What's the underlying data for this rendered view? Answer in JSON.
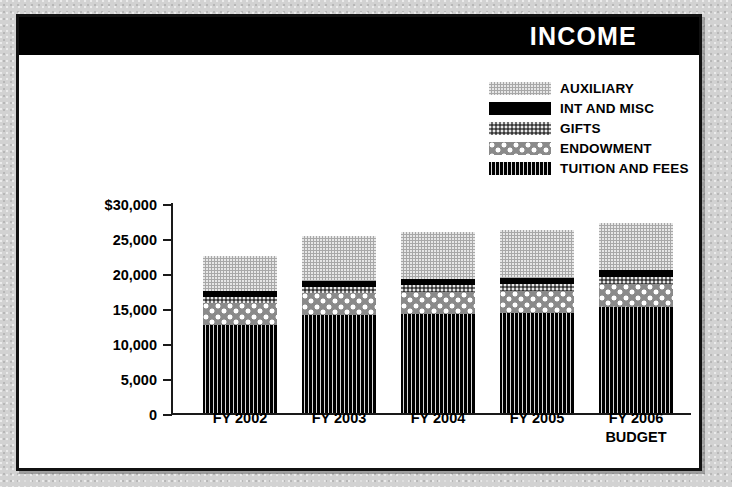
{
  "header": {
    "title": "INCOME"
  },
  "legend": {
    "position": "top-right",
    "items": [
      {
        "label": "AUXILIARY",
        "pattern": "auxiliary",
        "color": "#a8a8a8"
      },
      {
        "label": "INT AND MISC",
        "pattern": "int",
        "color": "#000000"
      },
      {
        "label": "GIFTS",
        "pattern": "gifts",
        "color": "#6f6f6f"
      },
      {
        "label": "ENDOWMENT",
        "pattern": "endowment",
        "color": "#8a8a8a"
      },
      {
        "label": "TUITION AND FEES",
        "pattern": "tuition",
        "color": "#111111"
      }
    ]
  },
  "axis": {
    "y_ticks": [
      "$30,000",
      "25,000",
      "20,000",
      "15,000",
      "10,000",
      "5,000",
      "0"
    ],
    "x_labels": [
      {
        "line1": "FY 2002",
        "line2": ""
      },
      {
        "line1": "FY 2003",
        "line2": ""
      },
      {
        "line1": "FY 2004",
        "line2": ""
      },
      {
        "line1": "FY 2005",
        "line2": ""
      },
      {
        "line1": "FY 2006",
        "line2": "BUDGET"
      }
    ]
  },
  "chart_data": {
    "type": "bar",
    "stacked": true,
    "title": "INCOME",
    "xlabel": "",
    "ylabel": "",
    "ylim": [
      0,
      30000
    ],
    "ytick_values": [
      0,
      5000,
      10000,
      15000,
      20000,
      25000,
      30000
    ],
    "grid": false,
    "legend_position": "top-right",
    "categories": [
      "FY 2002",
      "FY 2003",
      "FY 2004",
      "FY 2005",
      "FY 2006 BUDGET"
    ],
    "series": [
      {
        "name": "TUITION AND FEES",
        "values": [
          12600,
          14000,
          14100,
          14300,
          15200
        ]
      },
      {
        "name": "ENDOWMENT",
        "values": [
          3100,
          3100,
          3200,
          3200,
          3200
        ]
      },
      {
        "name": "GIFTS",
        "values": [
          900,
          900,
          1000,
          1000,
          1100
        ]
      },
      {
        "name": "INT AND MISC",
        "values": [
          800,
          800,
          800,
          800,
          900
        ]
      },
      {
        "name": "AUXILIARY",
        "values": [
          5100,
          6500,
          6800,
          6800,
          6800
        ]
      }
    ],
    "totals": [
      22500,
      25300,
      25900,
      26100,
      27200
    ]
  }
}
